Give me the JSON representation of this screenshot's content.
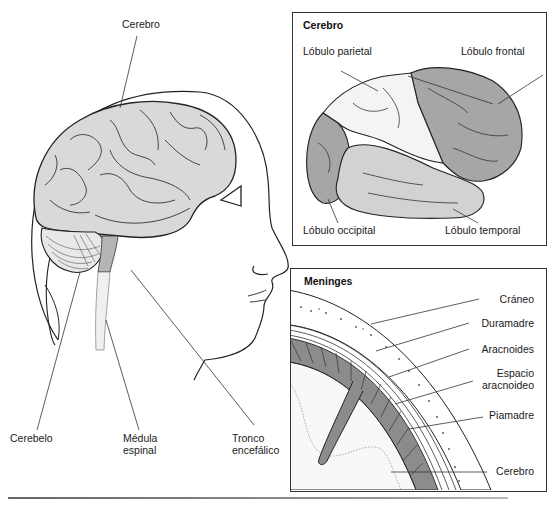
{
  "main_figure": {
    "labels": {
      "cerebro": "Cerebro",
      "cerebelo": "Cerebelo",
      "medula_line1": "Médula",
      "medula_line2": "espinal",
      "tronco_line1": "Tronco",
      "tronco_line2": "encefálico"
    }
  },
  "panel_cerebro": {
    "title": "Cerebro",
    "labels": {
      "parietal": "Lóbulo parietal",
      "frontal": "Lóbulo frontal",
      "occipital": "Lóbulo occipital",
      "temporal": "Lóbulo temporal"
    }
  },
  "panel_meninges": {
    "title": "Meninges",
    "labels": {
      "craneo": "Cráneo",
      "duramadre": "Duramadre",
      "aracnoides": "Aracnoides",
      "espacio_line1": "Espacio",
      "espacio_line2": "aracnoideo",
      "piamadre": "Piamadre",
      "cerebro": "Cerebro"
    }
  },
  "colors": {
    "brain_fill": "#d9d9d9",
    "lobe_dark": "#a6a6a6",
    "lobe_light": "#f4f4f4",
    "stem": "#b5b5b5",
    "outline": "#222222"
  }
}
